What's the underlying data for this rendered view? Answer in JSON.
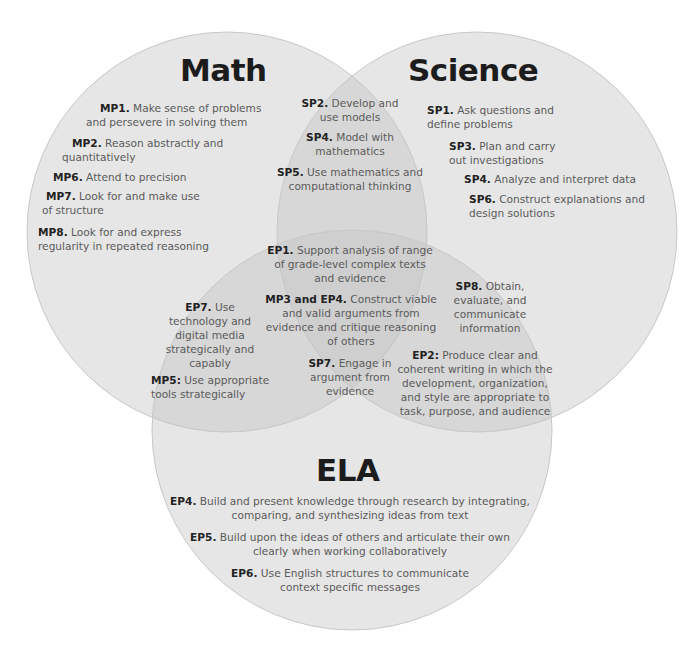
{
  "diagram": {
    "type": "venn",
    "colors": {
      "circle_fill": "#d9d9d9",
      "circle_stroke": "#c8c8c8",
      "title": "#1c1c1c",
      "body_text": "#5a5a5a",
      "code_text": "#222222"
    },
    "math": {
      "title": "Math",
      "items": [
        {
          "code": "MP1.",
          "text": " Make sense of problems and persevere in solving them"
        },
        {
          "code": "MP2.",
          "text": " Reason abstractly and quantitatively"
        },
        {
          "code": "MP6.",
          "text": " Attend to precision"
        },
        {
          "code": "MP7.",
          "text": " Look for and make use of structure"
        },
        {
          "code": "MP8.",
          "text": " Look for and express regularity in repeated reasoning"
        }
      ]
    },
    "science": {
      "title": "Science",
      "items": [
        {
          "code": "SP1.",
          "text": " Ask questions and define problems"
        },
        {
          "code": "SP3.",
          "text": " Plan and carry out investigations"
        },
        {
          "code": "SP4.",
          "text": " Analyze and interpret data"
        },
        {
          "code": "SP6.",
          "text": " Construct explanations and design solutions"
        }
      ]
    },
    "ela": {
      "title": "ELA",
      "items": [
        {
          "code": "EP4.",
          "text": " Build and present knowledge through research by integrating, comparing, and synthesizing ideas from text"
        },
        {
          "code": "EP5.",
          "text": " Build upon the ideas of others and articulate their own clearly when working collaboratively"
        },
        {
          "code": "EP6.",
          "text": " Use English structures to communicate context specific messages"
        }
      ]
    },
    "math_science": {
      "items": [
        {
          "code": "SP2.",
          "text": " Develop and use models"
        },
        {
          "code": "SP4.",
          "text": " Model with mathematics"
        },
        {
          "code": "SP5.",
          "text": " Use mathematics and computational thinking"
        }
      ]
    },
    "math_ela": {
      "items": [
        {
          "code": "EP7.",
          "text": " Use technology and digital media strategically and capably"
        },
        {
          "code": "MP5:",
          "text": " Use appropriate tools strategically"
        }
      ]
    },
    "science_ela": {
      "items": [
        {
          "code": "SP8.",
          "text": " Obtain, evaluate, and communicate information"
        },
        {
          "code": "EP2:",
          "text": " Produce clear and coherent writing in which the development, organization, and style are appropriate to task, purpose, and audience"
        }
      ]
    },
    "all_three": {
      "items": [
        {
          "code": "EP1.",
          "text": " Support analysis of range of grade-level complex texts and evidence"
        },
        {
          "code": "MP3 and EP4.",
          "text": " Construct viable and valid arguments from evidence and critique reasoning of others"
        },
        {
          "code": "SP7.",
          "text": " Engage in argument from evidence"
        }
      ]
    }
  }
}
